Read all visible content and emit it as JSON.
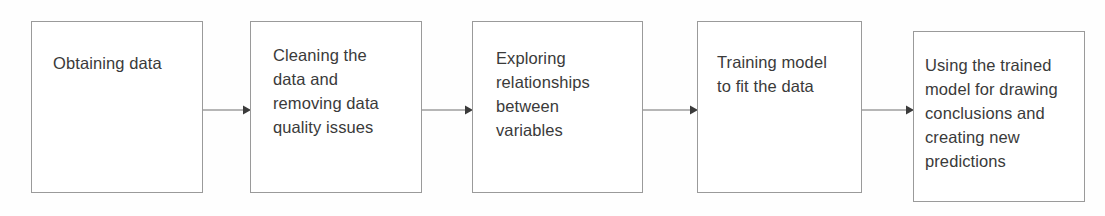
{
  "diagram": {
    "type": "flowchart",
    "orientation": "left-to-right",
    "colors": {
      "background": "#fefefe",
      "box_fill": "#ffffff",
      "box_border": "#9a9a9a",
      "text": "#3a3a3a",
      "connector": "#6f6f6f"
    },
    "stages": [
      {
        "id": "stage-1",
        "order": 1,
        "label": "Obtaining data"
      },
      {
        "id": "stage-2",
        "order": 2,
        "label": "Cleaning the\ndata and\nremoving data\nquality issues"
      },
      {
        "id": "stage-3",
        "order": 3,
        "label": "Exploring\nrelationships\nbetween\nvariables"
      },
      {
        "id": "stage-4",
        "order": 4,
        "label": "Training model\nto fit the data"
      },
      {
        "id": "stage-5",
        "order": 5,
        "label": "Using the trained\nmodel for drawing\nconclusions and\ncreating new\npredictions"
      }
    ],
    "connectors": [
      {
        "id": "arrow-1",
        "from": "stage-1",
        "to": "stage-2",
        "label": ""
      },
      {
        "id": "arrow-2",
        "from": "stage-2",
        "to": "stage-3",
        "label": ""
      },
      {
        "id": "arrow-3",
        "from": "stage-3",
        "to": "stage-4",
        "label": ""
      },
      {
        "id": "arrow-4",
        "from": "stage-4",
        "to": "stage-5",
        "label": ""
      }
    ]
  }
}
